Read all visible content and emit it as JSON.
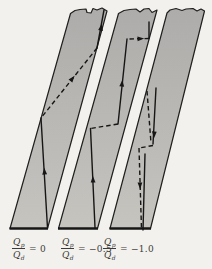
{
  "canvas": {
    "width": 212,
    "height": 269,
    "bg": "#f2f1ed"
  },
  "colors": {
    "strip_fill_top": "#aeacaa",
    "strip_fill_bottom": "#c6c4bf",
    "edge_stroke": "#1f1f1f",
    "bottom_edge_stroke": "#161616",
    "wave_stroke": "#161616",
    "label_color": "#3b3a38"
  },
  "strips": [
    {
      "id": "strip-ratio-0",
      "outline": "M10,228.5 L47.5,228.5 L107,11 L102,8 L97,10 L93,8.5 L91,13 L87,12.5 L86,9 L80,9.5 L75,10.5 L70.5,13.5 Z",
      "bottom_edge": "M9.5,228.5 L48,228.5",
      "solid": [
        "M104,10 L97,48",
        "M41,118 L47.5,228"
      ],
      "dashed": [
        "M97,48 L41,118"
      ],
      "arrows": [
        {
          "x": 101,
          "y": 28,
          "dx": 7,
          "dy": -38
        },
        {
          "x": 72,
          "y": 79,
          "dx": 56,
          "dy": -70
        },
        {
          "x": 44.5,
          "y": 172,
          "dx": -6.5,
          "dy": -110
        }
      ]
    },
    {
      "id": "strip-ratio-neg05",
      "outline": "M58.5,228.5 L97.5,228.5 L157,10 L152,12.5 L149,8.5 L144,9 L140,12 L136,9 L130,9.5 L124,10.5 L118.5,13.5 Z",
      "bottom_edge": "M58,228.5 L98,228.5",
      "solid": [
        "M149,38.5 L149,22",
        "M127,39 L118,124",
        "M90.5,128.5 L95,227.5"
      ],
      "dashed": [
        "M149,38.5 L127,39",
        "M118,124 L90.5,128.5"
      ],
      "arrows": [
        {
          "x": 140,
          "y": 38.7,
          "dx": 22,
          "dy": -1
        },
        {
          "x": 122,
          "y": 84,
          "dx": 9,
          "dy": -85
        },
        {
          "x": 93,
          "y": 180,
          "dx": -4.5,
          "dy": -99
        }
      ]
    },
    {
      "id": "strip-ratio-neg10",
      "outline": "M110,228.5 L150.5,228.5 L204.5,11 L201,9 L197,11 L193,8.5 L186,9 L182,10.5 L176,8.5 L170,10 L167,13 Z",
      "bottom_edge": "M109.5,228.5 L151,228.5",
      "solid": [
        "M156,88 L153,144",
        "M145,154 L143,230"
      ],
      "dashed": [
        "M147,91 L151,143",
        "M153,145.5 L139,148",
        "M139,148 L141.5,229"
      ],
      "arrows": [
        {
          "x": 154.2,
          "y": 134,
          "dx": -3,
          "dy": 55
        },
        {
          "x": 140,
          "y": 185,
          "dx": 2,
          "dy": 80
        }
      ]
    }
  ],
  "labels": [
    {
      "id": "label-ratio-0",
      "numerator": "Q",
      "numerator_sub": "p",
      "denominator": "Q",
      "denominator_sub": "d",
      "equals": "= 0",
      "x": 12,
      "y": 236
    },
    {
      "id": "label-ratio-neg05",
      "numerator": "Q",
      "numerator_sub": "p",
      "denominator": "Q",
      "denominator_sub": "d",
      "equals": "= −0.5",
      "x": 61,
      "y": 236
    },
    {
      "id": "label-ratio-neg10",
      "numerator": "Q",
      "numerator_sub": "p",
      "denominator": "Q",
      "denominator_sub": "d",
      "equals": "= −1.0",
      "x": 103,
      "y": 236
    }
  ]
}
